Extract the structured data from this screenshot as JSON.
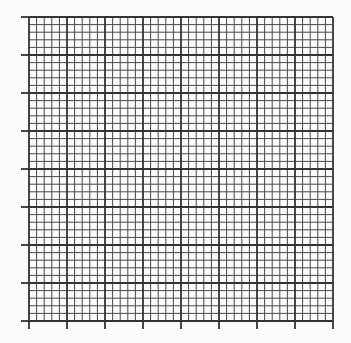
{
  "chart_data": {
    "type": "scatter",
    "title": "",
    "xlabel": "",
    "ylabel": "",
    "x_ticks": [
      "",
      "",
      "",
      "",
      "",
      "",
      "",
      "",
      ""
    ],
    "y_ticks": [
      "",
      "",
      "",
      "",
      "",
      "",
      "",
      "",
      ""
    ],
    "series": [],
    "grid": {
      "major_divisions_x": 8,
      "major_divisions_y": 8,
      "minor_per_major": 5
    },
    "legend": null
  },
  "style": {
    "background": "#fbfbfb",
    "minor_line_color": "#4a4a4a",
    "major_line_color": "#333333"
  },
  "layout": {
    "plot_left": 29,
    "plot_top": 17,
    "plot_size": 304,
    "tick_length": 8
  }
}
